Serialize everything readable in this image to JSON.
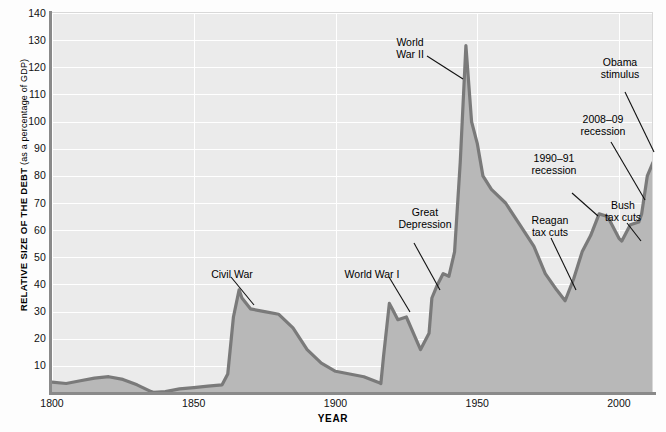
{
  "chart_data": {
    "type": "area",
    "title": "",
    "xlabel": "YEAR",
    "ylabel_main": "RELATIVE SIZE OF THE DEBT",
    "ylabel_sub": " (as a percentage of GDP)",
    "xlim": [
      1800,
      2012
    ],
    "ylim": [
      0,
      140
    ],
    "xticks": [
      1800,
      1850,
      1900,
      1950,
      2000
    ],
    "xticklabels": [
      "1800",
      "1850",
      "1900",
      "1950",
      "2000"
    ],
    "yticks": [
      10,
      20,
      30,
      40,
      50,
      60,
      70,
      80,
      90,
      100,
      110,
      120,
      130,
      140
    ],
    "yticklabels": [
      "10",
      "20",
      "30",
      "40",
      "50",
      "60",
      "70",
      "80",
      "90",
      "100",
      "110",
      "120",
      "130",
      "140"
    ],
    "grid": "horizontal-and-vertical-white",
    "legend": "none",
    "series_name": "U.S. federal debt as percentage of GDP",
    "x": [
      1800,
      1805,
      1810,
      1815,
      1820,
      1825,
      1830,
      1835,
      1836,
      1840,
      1845,
      1850,
      1855,
      1860,
      1862,
      1864,
      1866,
      1867,
      1870,
      1875,
      1880,
      1885,
      1890,
      1895,
      1900,
      1905,
      1910,
      1915,
      1916,
      1917,
      1919,
      1920,
      1922,
      1925,
      1930,
      1933,
      1934,
      1936,
      1938,
      1940,
      1942,
      1944,
      1946,
      1948,
      1950,
      1952,
      1955,
      1960,
      1965,
      1970,
      1974,
      1978,
      1981,
      1984,
      1987,
      1990,
      1993,
      1996,
      2000,
      2001,
      2004,
      2007,
      2008,
      2010,
      2012
    ],
    "y": [
      4,
      3.5,
      4.5,
      5.5,
      6,
      5,
      3,
      0.5,
      0.2,
      0.5,
      1.5,
      2,
      2.5,
      3,
      7,
      28,
      38,
      35,
      31,
      30,
      29,
      24,
      16,
      11,
      8,
      7,
      6,
      4,
      3.5,
      14,
      33,
      31,
      27,
      28,
      16,
      22,
      35,
      40,
      44,
      43,
      52,
      85,
      128,
      100,
      92,
      80,
      75,
      70,
      62,
      54,
      44,
      38,
      34,
      42,
      52,
      58,
      66,
      65,
      57,
      56,
      62,
      63,
      66,
      80,
      85
    ],
    "annotations": [
      {
        "label": "Civil War",
        "x": 1864,
        "y": 38
      },
      {
        "label": "World War I",
        "x": 1918,
        "y": 33
      },
      {
        "label": "Great Depression",
        "x": 1933,
        "y": 24
      },
      {
        "label": "World War II",
        "x": 1946,
        "y": 128
      },
      {
        "label": "Reagan tax cuts",
        "x": 1982,
        "y": 35
      },
      {
        "label": "1990–91 recession",
        "x": 1992,
        "y": 64
      },
      {
        "label": "Bush tax cuts",
        "x": 2003,
        "y": 60
      },
      {
        "label": "2008–09 recession",
        "x": 2008,
        "y": 67
      },
      {
        "label": "Obama stimulus",
        "x": 2011,
        "y": 84
      }
    ]
  },
  "axes": {
    "x_title": "YEAR",
    "y_title_bold": "RELATIVE SIZE OF THE DEBT",
    "y_title_plain": " (as a percentage of GDP)",
    "x_labels": [
      "1800",
      "1850",
      "1900",
      "1950",
      "2000"
    ],
    "y_labels": [
      "140",
      "130",
      "120",
      "110",
      "100",
      "90",
      "80",
      "70",
      "60",
      "50",
      "40",
      "30",
      "20",
      "10"
    ]
  },
  "annotations": {
    "civil_war": "Civil War",
    "world_war_i": "World War I",
    "great_depression": "Great\nDepression",
    "world_war_ii": "World\nWar II",
    "reagan": "Reagan\ntax cuts",
    "recession_1990": "1990–91\nrecession",
    "bush": "Bush\ntax cuts",
    "recession_2008": "2008–09\nrecession",
    "obama": "Obama\nstimulus"
  },
  "colors": {
    "plot_background": "#ebebeb",
    "area_fill": "#b8b8b8",
    "line": "#7a7a7a",
    "gridline": "#ffffff",
    "axis_rule": "#8a8a8a",
    "text": "#111111"
  }
}
